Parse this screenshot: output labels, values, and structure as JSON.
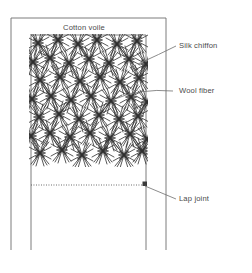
{
  "figure": {
    "type": "technical-cross-section-diagram",
    "background_color": "#ffffff",
    "line_color": "#6e6e6e",
    "text_color": "#4a4a4a",
    "fiber_color": "#3a3a3a"
  },
  "labels": {
    "cotton_voile": "Cotton voile",
    "silk_chiffon": "Silk chiffon",
    "wool_fiber": "Wool fiber",
    "lap_joint": "Lap joint"
  },
  "geometry": {
    "outer_panel": {
      "x": 11,
      "y": 18,
      "width": 155,
      "height": 232
    },
    "inner_panel": {
      "x": 31,
      "y": 35,
      "width": 115,
      "height": 215
    },
    "fiber_region": {
      "x": 31,
      "y": 35,
      "width": 115,
      "height": 130
    },
    "lap_joint_line": {
      "x1": 31,
      "y1": 185,
      "x2": 146,
      "y2": 185
    },
    "lap_joint_marker": {
      "x": 143,
      "y": 182,
      "width": 5,
      "height": 5
    }
  },
  "leaders": [
    {
      "name": "silk-chiffon-leader",
      "from_x": 142,
      "from_y": 62,
      "to_x": 175,
      "to_y": 46
    },
    {
      "name": "wool-fiber-leader",
      "from_x": 113,
      "from_y": 98,
      "to_x": 172,
      "to_y": 91
    },
    {
      "name": "lap-joint-leader",
      "from_x": 145,
      "from_y": 186,
      "to_x": 175,
      "to_y": 198
    }
  ],
  "label_positions": {
    "cotton_voile": {
      "x": 63,
      "y": 30
    },
    "silk_chiffon": {
      "x": 179,
      "y": 48
    },
    "wool_fiber": {
      "x": 179,
      "y": 93
    },
    "lap_joint": {
      "x": 179,
      "y": 200
    }
  },
  "fiber_pattern": {
    "description": "dense crossing diagonal wool fiber strokes forming star-like clusters",
    "rows": 7,
    "columns": 6,
    "cluster_count": 42
  }
}
